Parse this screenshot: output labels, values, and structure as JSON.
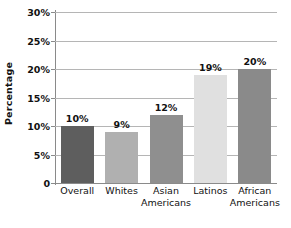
{
  "chart_data": {
    "type": "bar",
    "title": "",
    "subtitle": "",
    "xlabel": "",
    "ylabel": "Percentage",
    "ylim": [
      0,
      30
    ],
    "yunit": "%",
    "grid": true,
    "legend": null,
    "categories": [
      "Overall",
      "Whites",
      "Asian Americans",
      "Latinos",
      "African Americans"
    ],
    "category_lines": [
      [
        "Overall",
        ""
      ],
      [
        "Whites",
        ""
      ],
      [
        "Asian",
        "Americans"
      ],
      [
        "Latinos",
        ""
      ],
      [
        "African",
        "Americans"
      ]
    ],
    "values": [
      10,
      9,
      12,
      19,
      20
    ],
    "data_labels": [
      "10%",
      "9%",
      "12%",
      "19%",
      "20%"
    ],
    "bar_colors": [
      "#5e5e5e",
      "#b0b0b0",
      "#8f8f8f",
      "#e0e0e0",
      "#8a8a8a"
    ],
    "y_ticks": [
      {
        "value": 30,
        "label": "30%"
      },
      {
        "value": 25,
        "label": "25%"
      },
      {
        "value": 20,
        "label": "20%"
      },
      {
        "value": 15,
        "label": "15%"
      },
      {
        "value": 10,
        "label": "10%"
      },
      {
        "value": 5,
        "label": "5%"
      },
      {
        "value": 0,
        "label": "0"
      }
    ],
    "colors": {
      "background": "#ffffff",
      "gridline": "#b5b5b5",
      "axis": "#8a8a8a",
      "text": "#111111"
    }
  }
}
